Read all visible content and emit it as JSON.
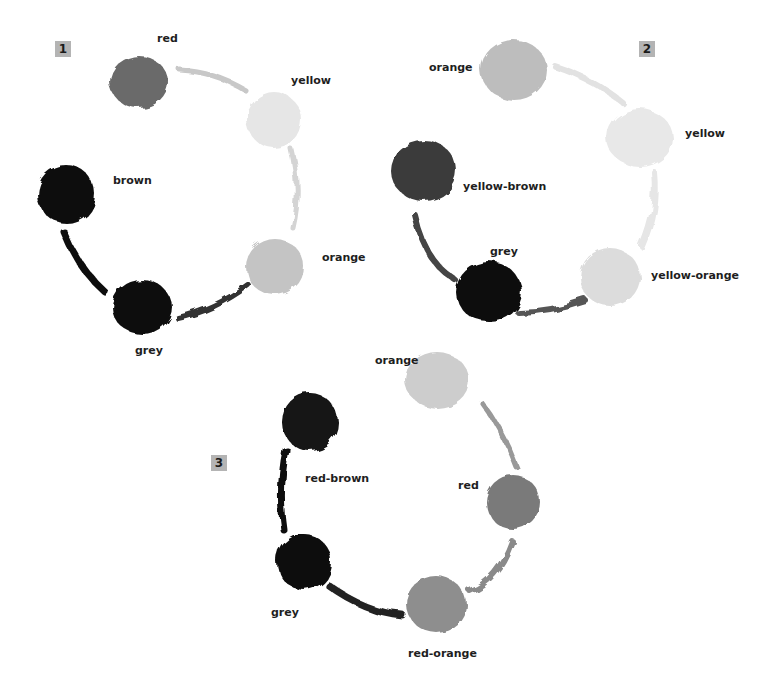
{
  "wheels": [
    {
      "number": "1",
      "swatches": [
        {
          "label": "red",
          "tone": "#6a6a6a"
        },
        {
          "label": "yellow",
          "tone": "#e6e6e6"
        },
        {
          "label": "orange",
          "tone": "#c4c4c4"
        },
        {
          "label": "grey",
          "tone": "#0c0c0c"
        },
        {
          "label": "brown",
          "tone": "#0a0a0a"
        }
      ]
    },
    {
      "number": "2",
      "swatches": [
        {
          "label": "orange",
          "tone": "#bdbdbd"
        },
        {
          "label": "yellow",
          "tone": "#e8e8e8"
        },
        {
          "label": "yellow-orange",
          "tone": "#dcdcdc"
        },
        {
          "label": "grey",
          "tone": "#111111"
        },
        {
          "label": "yellow-brown",
          "tone": "#3a3a3a"
        }
      ]
    },
    {
      "number": "3",
      "swatches": [
        {
          "label": "orange",
          "tone": "#cdcdcd"
        },
        {
          "label": "red",
          "tone": "#7a7a7a"
        },
        {
          "label": "red-orange",
          "tone": "#8e8e8e"
        },
        {
          "label": "grey",
          "tone": "#080808"
        },
        {
          "label": "red-brown",
          "tone": "#121212"
        }
      ]
    }
  ]
}
